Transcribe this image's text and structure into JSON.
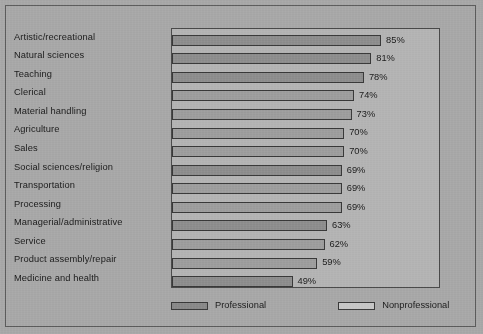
{
  "chart_data": {
    "type": "bar",
    "orientation": "horizontal",
    "title": "",
    "subtitle": "",
    "xlabel": "",
    "ylabel": "",
    "xlim": [
      0,
      100
    ],
    "grid": false,
    "legend_position": "bottom",
    "value_suffix": "%",
    "categories": [
      "Artistic/recreational",
      "Natural sciences",
      "Teaching",
      "Clerical",
      "Material handling",
      "Agriculture",
      "Sales",
      "Social sciences/religion",
      "Transportation",
      "Processing",
      "Managerial/administrative",
      "Service",
      "Product assembly/repair",
      "Medicine and health"
    ],
    "values": [
      85,
      81,
      78,
      74,
      73,
      70,
      70,
      69,
      69,
      69,
      63,
      62,
      59,
      49
    ],
    "value_labels": [
      "85%",
      "81%",
      "78%",
      "74%",
      "73%",
      "70%",
      "70%",
      "69%",
      "69%",
      "69%",
      "63%",
      "62%",
      "59%",
      "49%"
    ],
    "series_assignment": [
      "Professional",
      "Professional",
      "Professional",
      "Nonprofessional",
      "Nonprofessional",
      "Nonprofessional",
      "Nonprofessional",
      "Professional",
      "Nonprofessional",
      "Nonprofessional",
      "Professional",
      "Nonprofessional",
      "Nonprofessional",
      "Professional"
    ],
    "legend": [
      {
        "label": "Professional",
        "swatch": "professional",
        "color": "#8a8a8a"
      },
      {
        "label": "Nonprofessional",
        "swatch": "nonprofessional",
        "color": "#c6c6c6"
      }
    ],
    "colors": {
      "professional": "#8e8e8e",
      "nonprofessional": "#9e9e9e",
      "plot_background": "#b4b4b4",
      "page_background": "#a8a8a8",
      "bar_outline": "#3a3a3a",
      "text": "#1c1c1c"
    }
  }
}
